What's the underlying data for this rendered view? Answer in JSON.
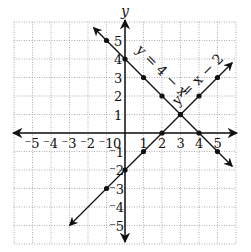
{
  "chart_data": {
    "type": "line",
    "title": "",
    "xlabel": "",
    "ylabel": "y",
    "xlim": [
      -6,
      6
    ],
    "ylim": [
      -6,
      6
    ],
    "grid": true,
    "grid_style": "dotted",
    "x_ticks": [
      "-5",
      "-4",
      "-3",
      "-2",
      "-1",
      "0",
      "1",
      "2",
      "3",
      "4",
      "5"
    ],
    "y_ticks": [
      "5",
      "4",
      "3",
      "2",
      "1",
      "-1",
      "-2",
      "-3",
      "-4",
      "-5"
    ],
    "series": [
      {
        "name": "y = 4 - x",
        "label": "y = 4 − x",
        "points": [
          [
            -1,
            5
          ],
          [
            0,
            4
          ],
          [
            1,
            3
          ],
          [
            2,
            2
          ],
          [
            3,
            1
          ],
          [
            4,
            0
          ],
          [
            5,
            -1
          ]
        ],
        "arrow_start": [
          -1.7,
          5.7
        ],
        "arrow_end": [
          5.8,
          -1.8
        ]
      },
      {
        "name": "y = x - 2",
        "label": "y = x − 2",
        "points": [
          [
            -1,
            -3
          ],
          [
            0,
            -2
          ],
          [
            1,
            -1
          ],
          [
            2,
            0
          ],
          [
            3,
            1
          ],
          [
            4,
            2
          ],
          [
            5,
            3
          ]
        ],
        "arrow_start": [
          -3,
          -5
        ],
        "arrow_end": [
          5.8,
          3.8
        ]
      }
    ],
    "intersection": [
      3,
      1
    ],
    "legend_position": "none"
  },
  "labels": {
    "y_axis": "y",
    "origin": "0",
    "eq1": "y = 4 − x",
    "eq2": "y = x − 2"
  },
  "colors": {
    "axis": "#111111",
    "grid": "#9a9a9a",
    "line": "#111111"
  }
}
